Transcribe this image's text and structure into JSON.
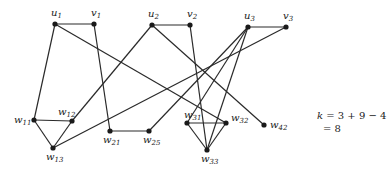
{
  "diagram": {
    "nodes": [
      {
        "id": "u1",
        "base": "u",
        "sub": "1",
        "x": 55,
        "y": 24,
        "lx": -4,
        "ly": -8
      },
      {
        "id": "v1",
        "base": "v",
        "sub": "1",
        "x": 94,
        "y": 24,
        "lx": -3,
        "ly": -8
      },
      {
        "id": "u2",
        "base": "u",
        "sub": "2",
        "x": 152,
        "y": 25,
        "lx": -4,
        "ly": -8
      },
      {
        "id": "v2",
        "base": "v",
        "sub": "2",
        "x": 190,
        "y": 25,
        "lx": -3,
        "ly": -8
      },
      {
        "id": "u3",
        "base": "u",
        "sub": "3",
        "x": 248,
        "y": 27,
        "lx": -4,
        "ly": -8
      },
      {
        "id": "v3",
        "base": "v",
        "sub": "3",
        "x": 286,
        "y": 27,
        "lx": -3,
        "ly": -8
      },
      {
        "id": "w11",
        "base": "w",
        "sub": "11",
        "x": 34,
        "y": 120,
        "lx": -20,
        "ly": 3
      },
      {
        "id": "w12",
        "base": "w",
        "sub": "12",
        "x": 72,
        "y": 121,
        "lx": -14,
        "ly": -6
      },
      {
        "id": "w13",
        "base": "w",
        "sub": "13",
        "x": 53,
        "y": 148,
        "lx": -7,
        "ly": 12
      },
      {
        "id": "w21",
        "base": "w",
        "sub": "21",
        "x": 110,
        "y": 131,
        "lx": -7,
        "ly": 12
      },
      {
        "id": "w25",
        "base": "w",
        "sub": "25",
        "x": 149,
        "y": 131,
        "lx": -6,
        "ly": 12
      },
      {
        "id": "w31",
        "base": "w",
        "sub": "31",
        "x": 187,
        "y": 123,
        "lx": -3,
        "ly": -5
      },
      {
        "id": "w32",
        "base": "w",
        "sub": "32",
        "x": 226,
        "y": 123,
        "lx": 5,
        "ly": -2
      },
      {
        "id": "w33",
        "base": "w",
        "sub": "33",
        "x": 207,
        "y": 150,
        "lx": -6,
        "ly": 12
      },
      {
        "id": "w42",
        "base": "w",
        "sub": "42",
        "x": 264,
        "y": 125,
        "lx": 6,
        "ly": 3
      }
    ],
    "edges": [
      [
        "u1",
        "v1"
      ],
      [
        "u1",
        "w11"
      ],
      [
        "u1",
        "w32"
      ],
      [
        "v1",
        "w21"
      ],
      [
        "u2",
        "v2"
      ],
      [
        "u2",
        "w12"
      ],
      [
        "u2",
        "w42"
      ],
      [
        "v2",
        "w33"
      ],
      [
        "u3",
        "v3"
      ],
      [
        "u3",
        "w31"
      ],
      [
        "u3",
        "w33"
      ],
      [
        "v3",
        "w13"
      ],
      [
        "w11",
        "w12"
      ],
      [
        "w11",
        "w13"
      ],
      [
        "w12",
        "w13"
      ],
      [
        "w21",
        "w25"
      ],
      [
        "w25",
        "u3"
      ],
      [
        "w31",
        "w32"
      ],
      [
        "w31",
        "w33"
      ],
      [
        "w32",
        "w33"
      ]
    ],
    "formula": {
      "line1_var": "k",
      "line1_rest": " = 3 + 9 − 4",
      "line2": "= 8"
    }
  }
}
